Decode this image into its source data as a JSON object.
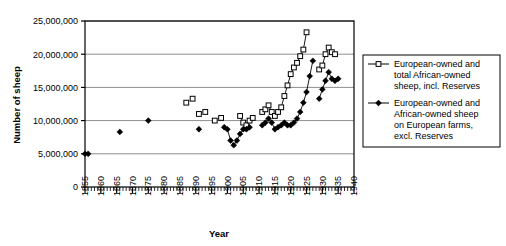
{
  "chart_data": {
    "type": "scatter",
    "title": "",
    "xlabel": "Year",
    "ylabel": "Number of sheep",
    "xlim": [
      1855,
      1940
    ],
    "ylim": [
      0,
      25000000
    ],
    "xticks": [
      1855,
      1860,
      1865,
      1870,
      1875,
      1880,
      1885,
      1890,
      1895,
      1900,
      1905,
      1910,
      1915,
      1920,
      1925,
      1930,
      1935,
      1940
    ],
    "xtick_labels": [
      "1855",
      "1860",
      "1865",
      "1870",
      "1875",
      "1880",
      "1885",
      "1890",
      "1895",
      "1900",
      "1905",
      "1910",
      "1915",
      "1920",
      "1925",
      "1930",
      "1935",
      "1940"
    ],
    "xtick_minor_step": 1,
    "yticks": [
      0,
      5000000,
      10000000,
      15000000,
      20000000,
      25000000
    ],
    "ytick_labels": [
      "0",
      "5,000,000",
      "10,000,000",
      "15,000,000",
      "20,000,000",
      "25,000,000"
    ],
    "grid": "horizontal",
    "grid_color": "#808080",
    "legend_position": "right",
    "series": [
      {
        "name": "European-owned and total African-owned sheep, incl. Reserves",
        "marker": "open-square",
        "color": "#000000",
        "points": [
          [
            1887,
            12700000
          ],
          [
            1889,
            13300000
          ],
          [
            1891,
            11000000
          ],
          [
            1893,
            11300000
          ],
          [
            1896,
            10000000
          ],
          [
            1898,
            10400000
          ],
          [
            1904,
            10700000
          ],
          [
            1905,
            9700000
          ],
          [
            1906,
            9300000
          ],
          [
            1907,
            10000000
          ],
          [
            1908,
            10400000
          ],
          [
            1911,
            11300000
          ],
          [
            1912,
            11700000
          ],
          [
            1913,
            12300000
          ],
          [
            1914,
            11300000
          ],
          [
            1915,
            10700000
          ],
          [
            1916,
            11300000
          ],
          [
            1917,
            12000000
          ],
          [
            1918,
            13700000
          ],
          [
            1919,
            15300000
          ],
          [
            1920,
            17000000
          ],
          [
            1921,
            18000000
          ],
          [
            1922,
            18700000
          ],
          [
            1923,
            19700000
          ],
          [
            1924,
            20700000
          ],
          [
            1925,
            23300000
          ],
          [
            1929,
            17700000
          ],
          [
            1930,
            18300000
          ],
          [
            1931,
            20000000
          ],
          [
            1932,
            21000000
          ],
          [
            1933,
            20300000
          ],
          [
            1934,
            20000000
          ]
        ]
      },
      {
        "name": "European-owned and African-owned sheep on European farms, excl. Reserves",
        "marker": "filled-diamond",
        "color": "#000000",
        "points": [
          [
            1855,
            5000000
          ],
          [
            1856,
            5000000
          ],
          [
            1866,
            8300000
          ],
          [
            1875,
            10000000
          ],
          [
            1891,
            8700000
          ],
          [
            1899,
            9000000
          ],
          [
            1900,
            8700000
          ],
          [
            1901,
            7000000
          ],
          [
            1902,
            6300000
          ],
          [
            1903,
            7000000
          ],
          [
            1904,
            8000000
          ],
          [
            1905,
            8700000
          ],
          [
            1906,
            8700000
          ],
          [
            1907,
            9000000
          ],
          [
            1911,
            9300000
          ],
          [
            1912,
            9700000
          ],
          [
            1913,
            10300000
          ],
          [
            1914,
            9700000
          ],
          [
            1915,
            8700000
          ],
          [
            1916,
            9000000
          ],
          [
            1917,
            9300000
          ],
          [
            1918,
            9700000
          ],
          [
            1919,
            9300000
          ],
          [
            1920,
            9300000
          ],
          [
            1921,
            9700000
          ],
          [
            1922,
            10300000
          ],
          [
            1923,
            11300000
          ],
          [
            1924,
            12700000
          ],
          [
            1925,
            14300000
          ],
          [
            1926,
            16700000
          ],
          [
            1927,
            19000000
          ],
          [
            1929,
            13300000
          ],
          [
            1930,
            14700000
          ],
          [
            1931,
            16000000
          ],
          [
            1932,
            17300000
          ],
          [
            1933,
            16300000
          ],
          [
            1934,
            16000000
          ],
          [
            1935,
            16300000
          ]
        ]
      }
    ]
  },
  "legend": {
    "entries": [
      {
        "marker": "open-square",
        "lines": [
          "European-owned and",
          "total African-owned",
          "sheep, incl. Reserves"
        ]
      },
      {
        "marker": "filled-diamond",
        "lines": [
          "European-owned and",
          "African-owned sheep",
          "on European farms,",
          "excl. Reserves"
        ]
      }
    ]
  }
}
